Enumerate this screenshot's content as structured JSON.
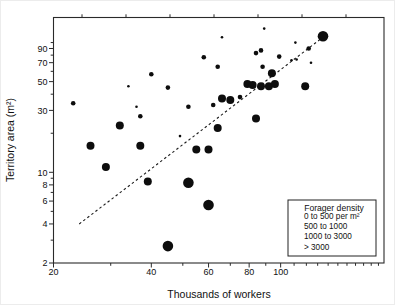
{
  "figure": {
    "xlabel": "Thousands of workers",
    "ylabel": "Territory area (m²)",
    "legend": {
      "title": "Forager density",
      "items": [
        {
          "label": "0 to 500 per m²",
          "size_class": "s"
        },
        {
          "label": "500 to 1000",
          "size_class": "m"
        },
        {
          "label": "1000 to 3000",
          "size_class": "l"
        },
        {
          "label": "> 3000",
          "size_class": "xl"
        }
      ]
    }
  },
  "chart_data": {
    "type": "scatter",
    "title": "",
    "xlabel": "Thousands of workers",
    "ylabel": "Territory area (m²)",
    "x_scale": "log",
    "y_scale": "log",
    "xlim": [
      20,
      208
    ],
    "ylim": [
      2,
      156
    ],
    "x_ticks_labeled": [
      20,
      40,
      60,
      80,
      100
    ],
    "x_ticks_minor": [
      30,
      50,
      70,
      90,
      110,
      120,
      130,
      140,
      150,
      160,
      170,
      180,
      190,
      200
    ],
    "y_ticks_labeled": [
      2,
      4,
      6,
      8,
      10,
      30,
      50,
      70,
      90
    ],
    "y_ticks_minor": [
      3,
      5,
      7,
      9,
      20,
      40,
      60,
      80,
      100
    ],
    "grid": false,
    "legend_position": "lower right",
    "marker_legend_title": "Forager density",
    "series": [
      {
        "name": "0 to 500 per m²",
        "size_class": "s",
        "points": [
          [
            34,
            46
          ],
          [
            36,
            32
          ],
          [
            49,
            19
          ],
          [
            66,
            110
          ],
          [
            89,
            128
          ],
          [
            108,
            73
          ],
          [
            111,
            100
          ],
          [
            112,
            74
          ],
          [
            124,
            70
          ]
        ]
      },
      {
        "name": "500 to 1000",
        "size_class": "m",
        "points": [
          [
            23,
            34
          ],
          [
            37,
            27
          ],
          [
            40,
            57
          ],
          [
            45,
            45
          ],
          [
            52,
            32
          ],
          [
            58,
            77
          ],
          [
            62,
            33
          ],
          [
            64,
            65
          ],
          [
            75,
            38
          ],
          [
            84,
            83
          ],
          [
            87,
            87
          ],
          [
            88,
            65
          ],
          [
            99,
            78
          ],
          [
            122,
            90
          ]
        ]
      },
      {
        "name": "1000 to 3000",
        "size_class": "l",
        "points": [
          [
            26,
            16
          ],
          [
            29,
            11
          ],
          [
            32,
            23
          ],
          [
            37,
            16
          ],
          [
            39,
            8.5
          ],
          [
            55,
            15
          ],
          [
            60,
            15
          ],
          [
            64,
            22
          ],
          [
            66,
            37
          ],
          [
            70,
            36
          ],
          [
            79,
            48
          ],
          [
            82,
            47
          ],
          [
            84,
            26
          ],
          [
            87,
            46
          ],
          [
            92,
            46
          ],
          [
            94,
            58
          ],
          [
            96,
            48
          ],
          [
            119,
            46
          ]
        ]
      },
      {
        "name": "> 3000",
        "size_class": "xl",
        "points": [
          [
            45,
            2.7
          ],
          [
            52,
            8.3
          ],
          [
            60,
            5.6
          ],
          [
            135,
            112
          ]
        ]
      }
    ],
    "trend_line": {
      "style": "dashed",
      "from": [
        24,
        4
      ],
      "to": [
        135,
        110
      ]
    }
  },
  "colors": {
    "marker": "#0d0d0d",
    "axis": "#2a2a2a",
    "background": "#ffffff"
  }
}
